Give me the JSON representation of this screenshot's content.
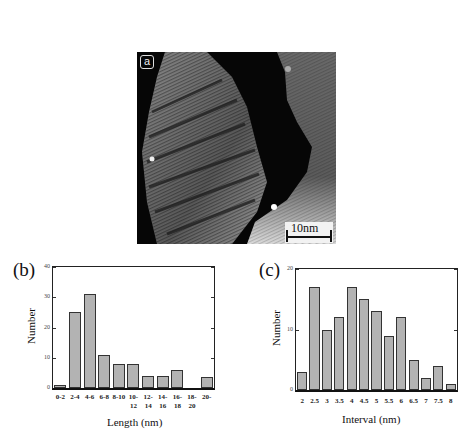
{
  "figure": {
    "panel_a": {
      "label": "a",
      "scale_bar": "10nm"
    },
    "panel_b": {
      "label": "(b)",
      "ylabel": "Number",
      "xlabel": "Length (nm)",
      "yticks": [
        "0",
        "10",
        "20",
        "30",
        "40"
      ]
    },
    "panel_c": {
      "label": "(c)",
      "ylabel": "Number",
      "xlabel": "Interval (nm)",
      "yticks": [
        "0",
        "10",
        "20"
      ]
    }
  },
  "chart_data": [
    {
      "type": "bar",
      "title": "(b)",
      "categories": [
        "0-2",
        "2-4",
        "4-6",
        "6-8",
        "8-10",
        "10-12",
        "12-14",
        "14-16",
        "16-18",
        "18-20",
        "20-"
      ],
      "values": [
        1,
        25,
        31,
        11,
        8,
        8,
        4,
        4,
        6,
        0,
        3.5
      ],
      "xlabel": "Length (nm)",
      "ylabel": "Number",
      "ylim": [
        0,
        40
      ],
      "yticks": [
        0,
        10,
        20,
        30,
        40
      ],
      "grid": false,
      "legend": null
    },
    {
      "type": "bar",
      "title": "(c)",
      "categories": [
        "2",
        "2.5",
        "3",
        "3.5",
        "4",
        "4.5",
        "5",
        "5.5",
        "6",
        "6.5",
        "7",
        "7.5",
        "8"
      ],
      "values": [
        3,
        17,
        10,
        12,
        17,
        15,
        13,
        9,
        12,
        5,
        2,
        4,
        1
      ],
      "xlabel": "Interval (nm)",
      "ylabel": "Number",
      "ylim": [
        0,
        20
      ],
      "yticks": [
        0,
        10,
        20
      ],
      "grid": false,
      "legend": null
    }
  ]
}
